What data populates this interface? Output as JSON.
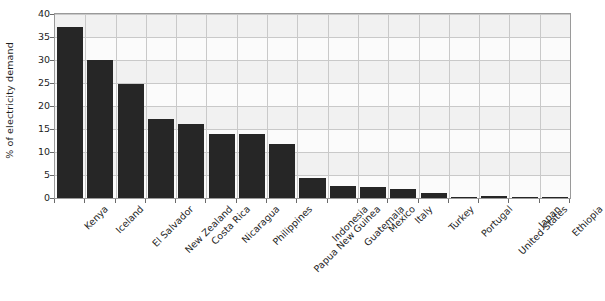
{
  "chart_data": {
    "type": "bar",
    "title": "",
    "subtitle": "",
    "xlabel": "",
    "ylabel": "% of electricity demand",
    "ylim": [
      0,
      40
    ],
    "yticks": [
      0,
      5,
      10,
      15,
      20,
      25,
      30,
      35,
      40
    ],
    "ytick_labels": [
      "0",
      "5",
      "10",
      "15",
      "20",
      "25",
      "30",
      "35",
      "40"
    ],
    "grid": true,
    "legend": false,
    "legend_position": "none",
    "categories": [
      "Kenya",
      "Iceland",
      "El Salvador",
      "New Zealand",
      "Costa Rica",
      "Nicaragua",
      "Philippines",
      "Papua New Guinea",
      "Indonesia",
      "Guatemala",
      "Mexico",
      "Italy",
      "Turkey",
      "Portugal",
      "United States",
      "Japan",
      "Ethiopia"
    ],
    "values": [
      37.2,
      29.9,
      24.7,
      17.1,
      16.0,
      14.0,
      13.9,
      11.8,
      4.4,
      2.7,
      2.3,
      1.9,
      1.1,
      0.2,
      0.4,
      0.2,
      0.05
    ],
    "bar_color": "#262626",
    "plot_background": "#fbfbfb",
    "grid_color": "#c9c9c9",
    "axis_color": "#9a9a9a"
  }
}
